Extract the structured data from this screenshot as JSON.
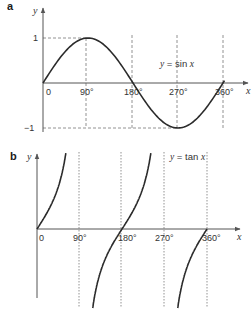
{
  "chart_data": [
    {
      "panel": "a",
      "type": "line",
      "title": "",
      "equation_label": "y = sin x",
      "xlabel": "x",
      "ylabel": "y",
      "x_ticks": [
        "0",
        "90°",
        "180°",
        "270°",
        "360°"
      ],
      "y_ticks": [
        "1",
        "−1"
      ],
      "xlim": [
        0,
        360
      ],
      "ylim": [
        -1,
        1
      ],
      "x": [
        0,
        90,
        180,
        270,
        360
      ],
      "series": [
        {
          "name": "sin x",
          "values": [
            0,
            1,
            0,
            -1,
            0
          ]
        }
      ],
      "guides": "dashed lines at y=1, y=-1 and x=90°, 180°, 270°, 360°"
    },
    {
      "panel": "b",
      "type": "line",
      "title": "",
      "equation_label": "y = tan x",
      "xlabel": "x",
      "ylabel": "y",
      "x_ticks": [
        "0",
        "90°",
        "180°",
        "270°",
        "360°"
      ],
      "xlim": [
        0,
        360
      ],
      "x": [
        0,
        45,
        135,
        180,
        225,
        315,
        360
      ],
      "series": [
        {
          "name": "tan x",
          "values": [
            0,
            1,
            -1,
            0,
            1,
            -1,
            0
          ]
        }
      ],
      "asymptotes": [
        90,
        270
      ],
      "guides": "dotted vertical lines at x=90°, 180°, 270°, 360°"
    }
  ],
  "panels": {
    "a": {
      "label": "a",
      "y_axis_name": "y",
      "x_axis_name": "x",
      "y_tick_top": "1",
      "y_tick_bottom": "−1",
      "x_ticks": [
        "0",
        "90°",
        "180°",
        "270°",
        "360°"
      ],
      "eq_y": "y",
      "eq_eq": " = ",
      "eq_fn": "sin ",
      "eq_x": "x"
    },
    "b": {
      "label": "b",
      "y_axis_name": "y",
      "x_axis_name": "x",
      "x_ticks": [
        "0",
        "90°",
        "180°",
        "270°",
        "360°"
      ],
      "eq_y": "y",
      "eq_eq": " = ",
      "eq_fn": "tan ",
      "eq_x": "x"
    }
  },
  "colors": {
    "curve": "#2b2b2b",
    "axis": "#555555",
    "guide": "#777777"
  }
}
